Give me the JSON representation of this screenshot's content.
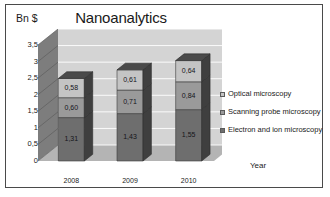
{
  "frame": {
    "border_color": "#4a4a4a"
  },
  "chart_data": {
    "type": "bar",
    "subtype": "stacked-column-3d",
    "title": "Nanoanalytics",
    "xlabel": "Year",
    "ylabel": "Bn $",
    "categories": [
      "2008",
      "2009",
      "2010"
    ],
    "series": [
      {
        "name": "Electron and ion microscopy",
        "values": [
          1.31,
          1.43,
          1.55
        ],
        "labels": [
          "1,31",
          "1,43",
          "1,55"
        ],
        "color": "#6e6e6e"
      },
      {
        "name": "Scanning probe microscopy",
        "values": [
          0.6,
          0.71,
          0.84
        ],
        "labels": [
          "0,60",
          "0,71",
          "0,84"
        ],
        "color": "#9a9a9a"
      },
      {
        "name": "Optical microscopy",
        "values": [
          0.58,
          0.61,
          0.64
        ],
        "labels": [
          "0,58",
          "0,61",
          "0,64"
        ],
        "color": "#c4c4c4"
      }
    ],
    "totals": [
      2.49,
      2.75,
      3.03
    ],
    "ylim": [
      0,
      3.5
    ],
    "ytick_values": [
      0,
      0.5,
      1,
      1.5,
      2,
      2.5,
      3,
      3.5
    ],
    "ytick_labels": [
      "0",
      "0,5",
      "1",
      "1,5",
      "2",
      "2,5",
      "3",
      "3,5"
    ],
    "grid": true,
    "legend_position": "right",
    "legend_order": [
      "Optical microscopy",
      "Scanning probe microscopy",
      "Electron and ion microscopy"
    ],
    "decimal_separator": ","
  },
  "legend": {
    "items": [
      {
        "label": "Optical microscopy",
        "color": "#c4c4c4"
      },
      {
        "label": "Scanning probe microscopy",
        "color": "#9a9a9a"
      },
      {
        "label": "Electron and ion microscopy",
        "color": "#6e6e6e"
      }
    ]
  },
  "plot_style": {
    "back_wall": "#d4d4d4",
    "side_wall": "#7d7d7d",
    "floor": "#b4b4b4",
    "gridline": "#ffffff",
    "bar_top_face": "#4a4a4a",
    "bar_side_face_dark": "#3f3f3f"
  }
}
